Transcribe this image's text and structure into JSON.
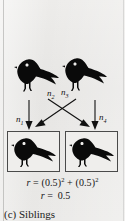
{
  "figure": {
    "caption_label": "(c)",
    "caption_text": "Siblings",
    "background_color": "#e8e8e6",
    "ink_color": "#0a0a0a",
    "box_border_color": "#4a4a4a"
  },
  "parents": [
    {
      "name": "parent-bird-left",
      "icon": "crow-silhouette-icon"
    },
    {
      "name": "parent-bird-right",
      "icon": "crow-silhouette-icon"
    }
  ],
  "offspring": [
    {
      "name": "offspring-box-left",
      "icon": "crow-silhouette-icon"
    },
    {
      "name": "offspring-box-right",
      "icon": "crow-silhouette-icon"
    }
  ],
  "gene_flow_labels": [
    {
      "id": "n1",
      "base": "n",
      "sub": "1",
      "from": "parent-left",
      "to": "offspring-left"
    },
    {
      "id": "n2",
      "base": "n",
      "sub": "2",
      "from": "parent-left",
      "to": "offspring-right"
    },
    {
      "id": "n3",
      "base": "n",
      "sub": "3",
      "from": "parent-right",
      "to": "offspring-left"
    },
    {
      "id": "n4",
      "base": "n",
      "sub": "4",
      "from": "parent-right",
      "to": "offspring-right"
    }
  ],
  "formula": {
    "line1": {
      "variable": "r",
      "equals": "=",
      "term1_base": "(0.5)",
      "term1_exp": "2",
      "plus": "+",
      "term2_base": "(0.5)",
      "term2_exp": "2"
    },
    "line2": {
      "variable": "r",
      "equals": "=",
      "value": "0.5"
    }
  }
}
